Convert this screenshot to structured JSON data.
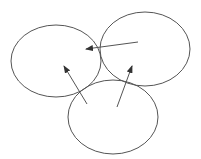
{
  "diagram": {
    "type": "three-ellipses-with-arrows",
    "stroke_color": "#555555",
    "background": "#ffffff",
    "ellipses": [
      {
        "id": "left",
        "cx": 56,
        "cy": 61,
        "rx": 45,
        "ry": 36
      },
      {
        "id": "right",
        "cx": 145,
        "cy": 49,
        "rx": 45,
        "ry": 37
      },
      {
        "id": "bottom",
        "cx": 113,
        "cy": 117,
        "rx": 45,
        "ry": 37
      }
    ],
    "arrows": [
      {
        "id": "right-to-left",
        "x1": 138,
        "y1": 42,
        "x2": 86,
        "y2": 49
      },
      {
        "id": "bottom-to-left",
        "x1": 87,
        "y1": 104,
        "x2": 64,
        "y2": 66
      },
      {
        "id": "bottom-to-right",
        "x1": 117,
        "y1": 107,
        "x2": 132,
        "y2": 66
      }
    ]
  }
}
